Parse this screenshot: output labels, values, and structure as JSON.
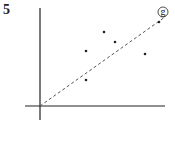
{
  "figure_number": "5",
  "chart_data": {
    "type": "scatter",
    "title": "",
    "xlabel": "",
    "ylabel": "",
    "xlim": [
      -15,
      125
    ],
    "ylim": [
      -14,
      98
    ],
    "grid": false,
    "points": [
      {
        "x": 46,
        "y": 55
      },
      {
        "x": 64,
        "y": 74
      },
      {
        "x": 75,
        "y": 64
      },
      {
        "x": 46,
        "y": 26
      },
      {
        "x": 105,
        "y": 52
      },
      {
        "x": 119,
        "y": 84
      }
    ],
    "line": {
      "style": "dashed",
      "from": {
        "x": 0,
        "y": 0
      },
      "to": {
        "x": 125,
        "y": 89
      },
      "label": "g"
    }
  },
  "colors": {
    "ink": "#222222",
    "line": "#555555"
  }
}
